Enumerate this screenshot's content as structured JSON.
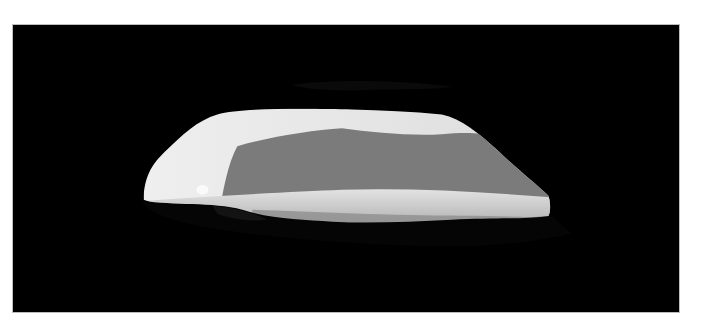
{
  "image": {
    "subject": "view through a dark rock cave opening onto a bright misty landscape",
    "colors": {
      "rock": "#000000",
      "sky_bright": "#e8e8e8",
      "distant_haze": "#7a7a7a",
      "foreground_band": "#d4d4d4",
      "frame_border": "#bdbdbd",
      "page_background": "#ffffff"
    }
  }
}
